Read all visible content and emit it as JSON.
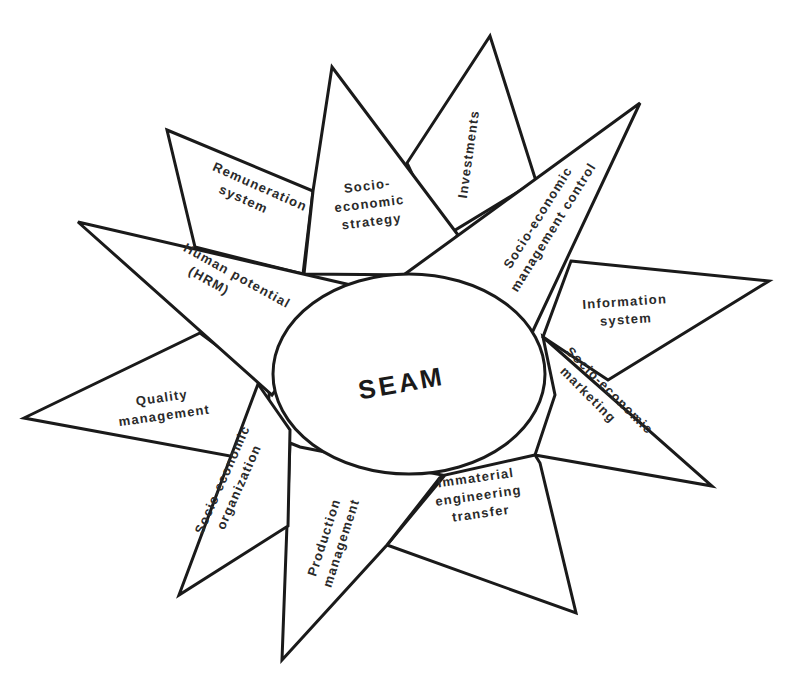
{
  "diagram": {
    "center": {
      "label": "SEAM"
    },
    "spokes": [
      {
        "id": "remuneration-system",
        "lines": [
          "Remuneration",
          "system"
        ]
      },
      {
        "id": "socio-economic-strategy",
        "lines": [
          "Socio-",
          "economic",
          "strategy"
        ]
      },
      {
        "id": "investments",
        "lines": [
          "Investments"
        ]
      },
      {
        "id": "socio-economic-management-control",
        "lines": [
          "Socio-economic",
          "management control"
        ]
      },
      {
        "id": "information-system",
        "lines": [
          "Information",
          "system"
        ]
      },
      {
        "id": "socio-economic-marketing",
        "lines": [
          "Socio-economic",
          "marketing"
        ]
      },
      {
        "id": "immaterial-engineering-transfer",
        "lines": [
          "Immaterial",
          "engineering",
          "transfer"
        ]
      },
      {
        "id": "production-management",
        "lines": [
          "Production",
          "management"
        ]
      },
      {
        "id": "socio-economic-organization",
        "lines": [
          "Socio-economic",
          "organization"
        ]
      },
      {
        "id": "quality-management",
        "lines": [
          "Quality",
          "management"
        ]
      },
      {
        "id": "human-potential",
        "lines": [
          "Human potential",
          "(HRM)"
        ]
      }
    ],
    "colors": {
      "stroke": "#1a1a1a",
      "fill": "#ffffff",
      "text": "#2a2a2a"
    }
  }
}
